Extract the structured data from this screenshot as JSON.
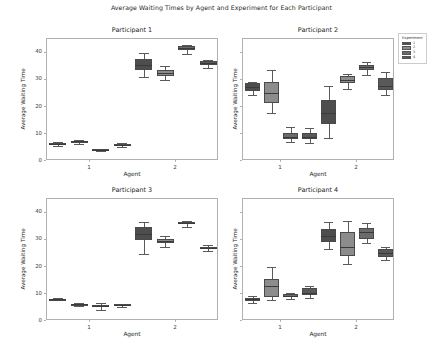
{
  "figure": {
    "title": "Average Waiting Times by Agent and Experiment for Each Participant",
    "width": 443,
    "height": 348
  },
  "legend": {
    "title": "Experiment",
    "entries": [
      {
        "label": "1",
        "color": "#4d4d4d"
      },
      {
        "label": "2",
        "color": "#8c8c8c"
      },
      {
        "label": "3",
        "color": "#6b6b6b"
      },
      {
        "label": "4",
        "color": "#595959"
      }
    ]
  },
  "axis_common": {
    "xlabel": "Agent",
    "ylabel": "Average Waiting Time",
    "xticklabels": [
      "1",
      "2"
    ],
    "yticklabels": [
      "0",
      "10",
      "20",
      "30",
      "40"
    ],
    "yticks": [
      0,
      10,
      20,
      30,
      40
    ],
    "ylim": [
      0,
      45
    ],
    "grid": false
  },
  "chart_data": {
    "type": "boxplot",
    "title": "Average Waiting Times by Agent and Experiment for Each Participant",
    "xlabel": "Agent",
    "ylabel": "Average Waiting Time",
    "ylim": [
      0,
      45
    ],
    "yticks": [
      0,
      10,
      20,
      30,
      40
    ],
    "grid": false,
    "legend_title": "Experiment",
    "legend_position": "upper right outside",
    "group_variable": "Agent",
    "groups": [
      "1",
      "2"
    ],
    "hue_variable": "Experiment",
    "hue_levels": [
      "1",
      "2",
      "3",
      "4"
    ],
    "hue_colors": [
      "#4d4d4d",
      "#8c8c8c",
      "#6b6b6b",
      "#595959"
    ],
    "panels": [
      {
        "title": "Participant 1",
        "yticklabels_visible": true,
        "boxes": [
          {
            "agent": "1",
            "experiment": "1",
            "whislo": 5.6,
            "q1": 6.0,
            "med": 6.4,
            "q3": 6.8,
            "whishi": 7.0
          },
          {
            "agent": "1",
            "experiment": "2",
            "whislo": 6.3,
            "q1": 6.9,
            "med": 7.2,
            "q3": 7.4,
            "whishi": 7.6
          },
          {
            "agent": "1",
            "experiment": "3",
            "whislo": 3.6,
            "q1": 3.9,
            "med": 4.1,
            "q3": 4.3,
            "whishi": 4.5
          },
          {
            "agent": "1",
            "experiment": "4",
            "whislo": 5.2,
            "q1": 5.7,
            "med": 6.0,
            "q3": 6.3,
            "whishi": 6.6
          },
          {
            "agent": "2",
            "experiment": "1",
            "whislo": 30.8,
            "q1": 33.4,
            "med": 35.4,
            "q3": 37.8,
            "whishi": 39.8
          },
          {
            "agent": "2",
            "experiment": "2",
            "whislo": 30.0,
            "q1": 31.4,
            "med": 32.3,
            "q3": 33.6,
            "whishi": 35.2
          },
          {
            "agent": "2",
            "experiment": "3",
            "whislo": 39.5,
            "q1": 41.0,
            "med": 41.8,
            "q3": 42.3,
            "whishi": 42.8
          },
          {
            "agent": "2",
            "experiment": "4",
            "whislo": 34.4,
            "q1": 35.4,
            "med": 36.2,
            "q3": 36.9,
            "whishi": 37.4
          }
        ]
      },
      {
        "title": "Participant 2",
        "yticklabels_visible": false,
        "boxes": [
          {
            "agent": "1",
            "experiment": "1",
            "whislo": 24.2,
            "q1": 26.0,
            "med": 27.4,
            "q3": 28.6,
            "whishi": 29.2
          },
          {
            "agent": "1",
            "experiment": "2",
            "whislo": 17.6,
            "q1": 21.4,
            "med": 25.0,
            "q3": 29.3,
            "whishi": 33.4
          },
          {
            "agent": "1",
            "experiment": "3",
            "whislo": 7.0,
            "q1": 8.2,
            "med": 9.0,
            "q3": 10.4,
            "whishi": 12.4
          },
          {
            "agent": "1",
            "experiment": "4",
            "whislo": 6.8,
            "q1": 8.0,
            "med": 9.0,
            "q3": 10.2,
            "whishi": 12.2
          },
          {
            "agent": "2",
            "experiment": "1",
            "whislo": 8.6,
            "q1": 13.8,
            "med": 17.8,
            "q3": 22.6,
            "whishi": 27.6
          },
          {
            "agent": "2",
            "experiment": "2",
            "whislo": 26.6,
            "q1": 28.6,
            "med": 30.0,
            "q3": 31.2,
            "whishi": 32.2
          },
          {
            "agent": "2",
            "experiment": "3",
            "whislo": 31.6,
            "q1": 33.6,
            "med": 34.6,
            "q3": 35.4,
            "whishi": 36.4
          },
          {
            "agent": "2",
            "experiment": "4",
            "whislo": 24.4,
            "q1": 26.2,
            "med": 27.6,
            "q3": 30.6,
            "whishi": 33.0
          }
        ]
      },
      {
        "title": "Participant 3",
        "yticklabels_visible": true,
        "boxes": [
          {
            "agent": "1",
            "experiment": "1",
            "whislo": 7.7,
            "q1": 7.9,
            "med": 8.0,
            "q3": 8.1,
            "whishi": 8.3
          },
          {
            "agent": "1",
            "experiment": "2",
            "whislo": 5.4,
            "q1": 5.8,
            "med": 6.1,
            "q3": 6.3,
            "whishi": 6.5
          },
          {
            "agent": "1",
            "experiment": "3",
            "whislo": 4.2,
            "q1": 5.0,
            "med": 5.5,
            "q3": 6.0,
            "whishi": 6.6
          },
          {
            "agent": "1",
            "experiment": "4",
            "whislo": 5.0,
            "q1": 5.6,
            "med": 6.0,
            "q3": 6.2,
            "whishi": 6.4
          },
          {
            "agent": "2",
            "experiment": "1",
            "whislo": 24.8,
            "q1": 30.0,
            "med": 32.1,
            "q3": 34.8,
            "whishi": 36.6
          },
          {
            "agent": "2",
            "experiment": "2",
            "whislo": 27.4,
            "q1": 28.8,
            "med": 29.4,
            "q3": 30.2,
            "whishi": 31.2
          },
          {
            "agent": "2",
            "experiment": "3",
            "whislo": 34.8,
            "q1": 35.6,
            "med": 36.0,
            "q3": 36.4,
            "whishi": 36.8
          },
          {
            "agent": "2",
            "experiment": "4",
            "whislo": 25.8,
            "q1": 26.4,
            "med": 26.9,
            "q3": 27.3,
            "whishi": 28.0
          }
        ]
      },
      {
        "title": "Participant 4",
        "yticklabels_visible": false,
        "boxes": [
          {
            "agent": "1",
            "experiment": "1",
            "whislo": 6.6,
            "q1": 7.4,
            "med": 8.0,
            "q3": 8.6,
            "whishi": 9.2
          },
          {
            "agent": "1",
            "experiment": "2",
            "whislo": 7.6,
            "q1": 9.0,
            "med": 13.0,
            "q3": 15.6,
            "whishi": 20.0
          },
          {
            "agent": "1",
            "experiment": "3",
            "whislo": 8.2,
            "q1": 9.0,
            "med": 9.4,
            "q3": 9.8,
            "whishi": 10.4
          },
          {
            "agent": "1",
            "experiment": "4",
            "whislo": 8.6,
            "q1": 9.6,
            "med": 10.4,
            "q3": 12.0,
            "whishi": 13.0
          },
          {
            "agent": "2",
            "experiment": "1",
            "whislo": 26.6,
            "q1": 29.0,
            "med": 31.4,
            "q3": 34.0,
            "whishi": 36.4
          },
          {
            "agent": "2",
            "experiment": "2",
            "whislo": 21.0,
            "q1": 23.8,
            "med": 27.4,
            "q3": 33.0,
            "whishi": 37.0
          },
          {
            "agent": "2",
            "experiment": "3",
            "whislo": 28.6,
            "q1": 30.4,
            "med": 32.8,
            "q3": 34.4,
            "whishi": 36.2
          },
          {
            "agent": "2",
            "experiment": "4",
            "whislo": 22.4,
            "q1": 23.6,
            "med": 25.0,
            "q3": 26.4,
            "whishi": 27.4
          }
        ]
      }
    ]
  }
}
